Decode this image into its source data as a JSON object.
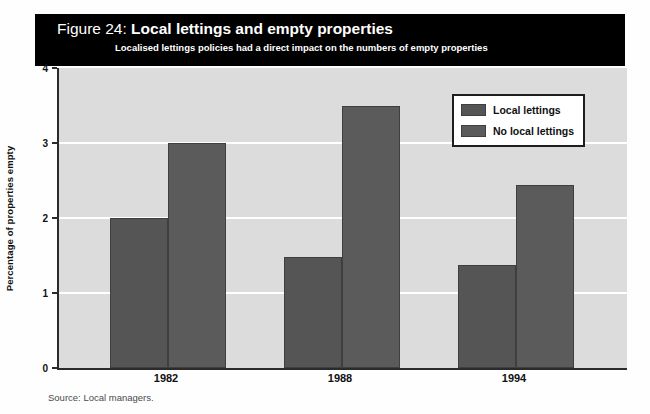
{
  "figure": {
    "title_prefix": "Figure 24: ",
    "title_main": "Local lettings and empty properties",
    "subtitle": "Localised lettings policies had a direct impact on the numbers of empty properties",
    "source": "Source: Local managers."
  },
  "legend": {
    "position": "top-right",
    "items": [
      {
        "label": "Local lettings",
        "color": "#555555"
      },
      {
        "label": "No local lettings",
        "color": "#5b5b5b"
      }
    ]
  },
  "colors": {
    "banner_background": "#000000",
    "banner_text": "#ffffff",
    "plot_background": "#dcdcdc",
    "gridline": "#ffffff",
    "axis": "#2b2b2b",
    "series_1": "#555555",
    "series_2": "#5b5b5b",
    "source_text": "#4a4a4a"
  },
  "axes": {
    "y_title": "Percentage of properties empty",
    "y_ticks": [
      0,
      1,
      2,
      3,
      4
    ],
    "y_tick_labels": [
      "0",
      "1",
      "2",
      "3",
      "4"
    ],
    "x_tick_labels": [
      "1982",
      "1988",
      "1994"
    ]
  },
  "chart_data": {
    "type": "bar",
    "title": "Figure 24: Local lettings and empty properties",
    "subtitle": "Localised lettings policies had a direct impact on the numbers of empty properties",
    "categories": [
      "1982",
      "1988",
      "1994"
    ],
    "series": [
      {
        "name": "Local lettings",
        "values": [
          2.0,
          1.48,
          1.37
        ]
      },
      {
        "name": "No local lettings",
        "values": [
          3.0,
          3.49,
          2.44
        ]
      }
    ],
    "xlabel": "",
    "ylabel": "Percentage of properties empty",
    "ylim": [
      0,
      4
    ],
    "yticks": [
      0,
      1,
      2,
      3,
      4
    ],
    "grid": true,
    "legend_position": "upper right",
    "source": "Source: Local managers."
  }
}
